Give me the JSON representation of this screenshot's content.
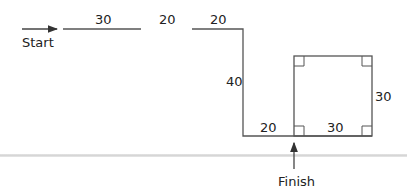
{
  "diagram": {
    "type": "path-route",
    "start_label": "Start",
    "finish_label": "Finish",
    "segments": [
      {
        "id": "seg-1",
        "label": "30",
        "orientation": "horizontal"
      },
      {
        "id": "gap",
        "label": "20",
        "orientation": "horizontal"
      },
      {
        "id": "seg-2",
        "label": "20",
        "orientation": "horizontal"
      },
      {
        "id": "seg-3",
        "label": "40",
        "orientation": "vertical"
      },
      {
        "id": "seg-4",
        "label": "20",
        "orientation": "horizontal"
      },
      {
        "id": "square-bottom",
        "label": "30",
        "orientation": "horizontal"
      },
      {
        "id": "square-right",
        "label": "30",
        "orientation": "vertical"
      }
    ],
    "square": {
      "side": "30",
      "right_angle_markers": 4
    },
    "colors": {
      "line": "#555555",
      "text": "#222222",
      "divider": "#dcdcdc"
    }
  }
}
